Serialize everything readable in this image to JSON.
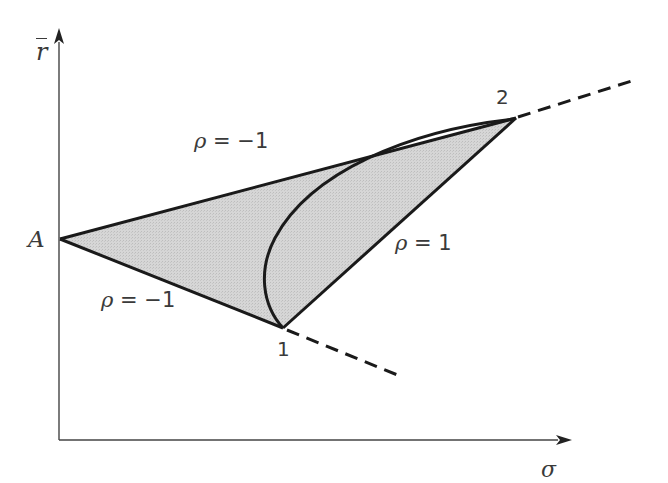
{
  "diagram": {
    "title": "",
    "axes": {
      "y_label": "r̄",
      "x_label": "σ"
    },
    "points": {
      "A": {
        "label": "A",
        "x": 60,
        "y": 239
      },
      "p1": {
        "label": "1",
        "x": 283,
        "y": 328
      },
      "p2": {
        "label": "2",
        "x": 516,
        "y": 118
      }
    },
    "edges": [
      {
        "from": "A",
        "to": "2",
        "label": "ρ = −1",
        "style": "solid"
      },
      {
        "from": "A",
        "to": "1",
        "label": "ρ = −1",
        "style": "solid"
      },
      {
        "from": "1",
        "to": "2",
        "label": "ρ = 1",
        "style": "solid"
      },
      {
        "from": "1",
        "to": "2",
        "label": "",
        "style": "curve"
      },
      {
        "from": "2",
        "to": "beyond",
        "label": "",
        "style": "dashed"
      },
      {
        "from": "1",
        "to": "beyond",
        "label": "",
        "style": "dashed"
      }
    ],
    "labels": {
      "rho_upper_prefix": "ρ",
      "rho_upper_rest": " = −1",
      "rho_lower_prefix": "ρ",
      "rho_lower_rest": " = −1",
      "rho_right_prefix": "ρ",
      "rho_right_rest": " = 1",
      "point_A": "A",
      "point_1": "1",
      "point_2": "2",
      "axis_y": "r",
      "axis_x": "σ"
    },
    "colors": {
      "line": "#1a1a1a",
      "fill": "#d4d4d4",
      "axis": "#333333",
      "text": "#3a3a3a"
    }
  }
}
